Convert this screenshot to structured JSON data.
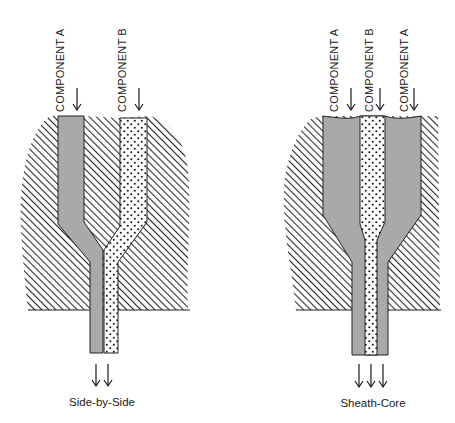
{
  "figure": {
    "colors": {
      "background": "#ffffff",
      "hatch": "#2a2a2a",
      "component_a_fill": "#a9a9a9",
      "component_b_fill": "#ffffff",
      "component_b_dots": "#1a1a1a",
      "outline": "#222222"
    },
    "panels": [
      {
        "id": "side-by-side",
        "caption": "Side-by-Side",
        "inlet_labels": [
          "COMPONENT A",
          "COMPONENT B"
        ],
        "outlet_arrow_count": 2
      },
      {
        "id": "sheath-core",
        "caption": "Sheath-Core",
        "inlet_labels": [
          "COMPONENT A",
          "COMPONENT B",
          "COMPONENT A"
        ],
        "outlet_arrow_count": 3
      }
    ],
    "legend": {
      "component_a_pattern": "solid gray",
      "component_b_pattern": "dotted",
      "die_body_pattern": "diagonal hatch"
    }
  }
}
